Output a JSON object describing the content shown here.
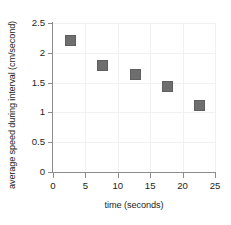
{
  "chart_data": {
    "type": "scatter",
    "title": "",
    "xlabel": "time (seconds)",
    "ylabel": "average speed during interval (cm/second)",
    "xlim": [
      0,
      25
    ],
    "ylim": [
      0,
      2.5
    ],
    "xticks": [
      "0",
      "5",
      "10",
      "15",
      "20",
      "25"
    ],
    "xtick_values": [
      0,
      5,
      10,
      15,
      20,
      25
    ],
    "yticks": [
      "0",
      "0.5",
      "1",
      "1.5",
      "2",
      "2.5"
    ],
    "ytick_values": [
      0,
      0.5,
      1,
      1.5,
      2,
      2.5
    ],
    "grid": true,
    "legend": "none",
    "marker_shape": "square",
    "marker_color": "#6e6e6e",
    "x": [
      2.5,
      7.5,
      12.5,
      17.5,
      22.5
    ],
    "y": [
      2.23,
      1.8,
      1.65,
      1.45,
      1.13
    ],
    "points": [
      {
        "x": 2.5,
        "y": 2.23
      },
      {
        "x": 7.5,
        "y": 1.8
      },
      {
        "x": 12.5,
        "y": 1.65
      },
      {
        "x": 17.5,
        "y": 1.45
      },
      {
        "x": 22.5,
        "y": 1.13
      }
    ]
  },
  "colors": {
    "marker": "#6e6e6e",
    "axis": "#8d8d8d",
    "grid": "#f1f1f1",
    "text": "#231f20",
    "background": "#ffffff"
  }
}
